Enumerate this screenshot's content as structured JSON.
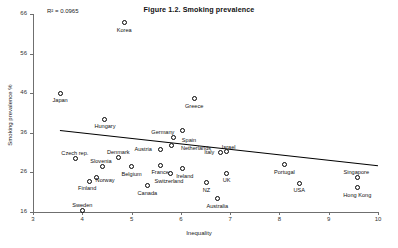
{
  "chart_data": {
    "type": "scatter",
    "title": "Figure 1.2. Smoking prevalence",
    "xlabel": "Inequality",
    "ylabel": "Smoking prevalence %",
    "xlim": [
      3,
      10
    ],
    "ylim": [
      16,
      66
    ],
    "xticks": [
      3,
      4,
      5,
      6,
      7,
      8,
      9,
      10
    ],
    "yticks": [
      16,
      26,
      36,
      46,
      56,
      66
    ],
    "grid": false,
    "legend": null,
    "annotations": [
      {
        "name": "r-squared",
        "text": "R² = 0.0965"
      }
    ],
    "trendline": {
      "x": [
        3.55,
        10.0
      ],
      "y": [
        36.8,
        27.9
      ]
    },
    "points": [
      {
        "label": "Korea",
        "x": 4.85,
        "y": 63.8,
        "label_dx": 0,
        "label_dy": 7
      },
      {
        "label": "Japan",
        "x": 3.55,
        "y": 46.0,
        "label_dx": 0,
        "label_dy": 7
      },
      {
        "label": "Greece",
        "x": 6.27,
        "y": 44.6,
        "label_dx": 0,
        "label_dy": 7
      },
      {
        "label": "Hungary",
        "x": 4.46,
        "y": 39.4,
        "label_dx": 0,
        "label_dy": 7
      },
      {
        "label": "Germany",
        "x": 6.04,
        "y": 36.5,
        "label_dx": -20,
        "label_dy": 1.5
      },
      {
        "label": "Spain",
        "x": 5.86,
        "y": 34.7,
        "label_dx": 15,
        "label_dy": 2
      },
      {
        "label": "Netherlands",
        "x": 5.8,
        "y": 32.9,
        "label_dx": 25,
        "label_dy": 2.5
      },
      {
        "label": "Austria",
        "x": 5.58,
        "y": 31.9,
        "label_dx": -17,
        "label_dy": -0.5
      },
      {
        "label": "Israel",
        "x": 6.93,
        "y": 31.4,
        "label_dx": 2,
        "label_dy": -4
      },
      {
        "label": "Italy",
        "x": 6.8,
        "y": 30.9,
        "label_dx": -11,
        "label_dy": -1
      },
      {
        "label": "Czech rep.",
        "x": 3.87,
        "y": 29.4,
        "label_dx": -1,
        "label_dy": -5.5
      },
      {
        "label": "Denmark",
        "x": 4.73,
        "y": 29.8,
        "label_dx": 0,
        "label_dy": -5.5
      },
      {
        "label": "Slovenia",
        "x": 4.4,
        "y": 27.6,
        "label_dx": -1,
        "label_dy": -5.5
      },
      {
        "label": "Belgium",
        "x": 5.0,
        "y": 27.4,
        "label_dx": 0,
        "label_dy": 7
      },
      {
        "label": "France",
        "x": 5.58,
        "y": 27.8,
        "label_dx": 0,
        "label_dy": 7
      },
      {
        "label": "Ireland",
        "x": 6.04,
        "y": 26.9,
        "label_dx": 2,
        "label_dy": 7
      },
      {
        "label": "Switzerland",
        "x": 5.78,
        "y": 25.6,
        "label_dx": -1,
        "label_dy": 7
      },
      {
        "label": "Portugal",
        "x": 8.1,
        "y": 27.9,
        "label_dx": 0,
        "label_dy": 7
      },
      {
        "label": "UK",
        "x": 6.93,
        "y": 25.8,
        "label_dx": 0,
        "label_dy": 7
      },
      {
        "label": "Norway",
        "x": 4.28,
        "y": 24.7,
        "label_dx": 9,
        "label_dy": 2
      },
      {
        "label": "Finland",
        "x": 4.14,
        "y": 23.8,
        "label_dx": -2,
        "label_dy": 7
      },
      {
        "label": "Canada",
        "x": 5.32,
        "y": 22.6,
        "label_dx": 0,
        "label_dy": 7
      },
      {
        "label": "NZ",
        "x": 6.52,
        "y": 23.4,
        "label_dx": 0,
        "label_dy": 7
      },
      {
        "label": "Singapore",
        "x": 9.58,
        "y": 24.6,
        "label_dx": -1,
        "label_dy": -5.5
      },
      {
        "label": "Hong Kong",
        "x": 9.58,
        "y": 22.1,
        "label_dx": 0,
        "label_dy": 7
      },
      {
        "label": "USA",
        "x": 8.4,
        "y": 23.3,
        "label_dx": 0,
        "label_dy": 7
      },
      {
        "label": "Australia",
        "x": 6.74,
        "y": 19.4,
        "label_dx": 0,
        "label_dy": 7
      },
      {
        "label": "Sweden",
        "x": 4.0,
        "y": 16.5,
        "label_dx": 0,
        "label_dy": -5.5
      }
    ]
  }
}
